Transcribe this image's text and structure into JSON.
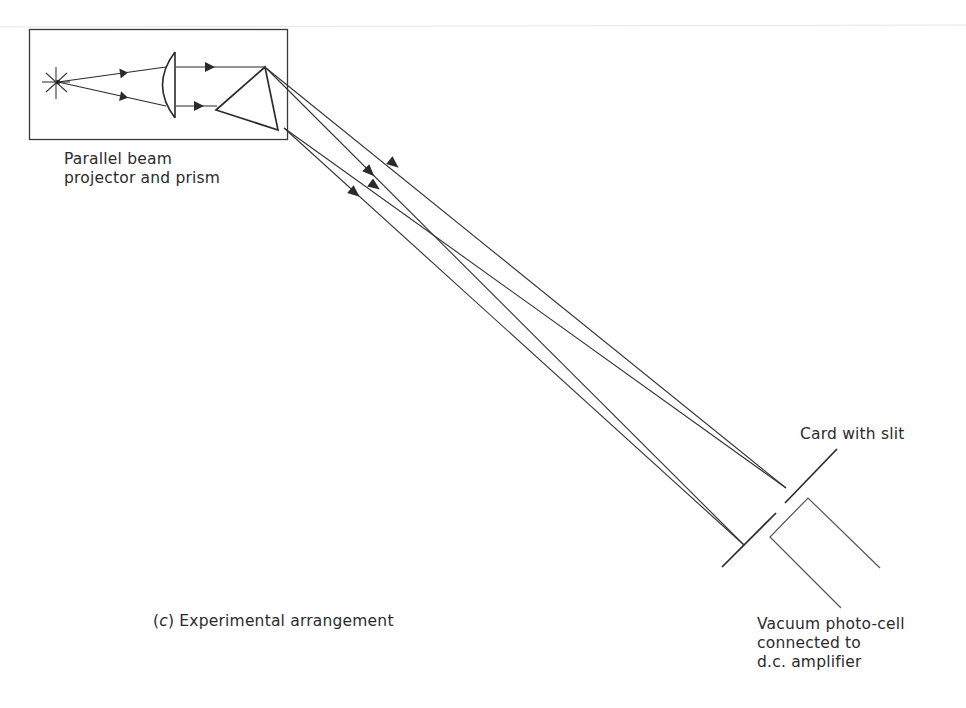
{
  "diagram": {
    "title": "Experimental arrangement",
    "panel_label": "(c)",
    "stroke_color": "#2b2b2b",
    "background": "#ffffff",
    "components": {
      "projector": {
        "label_lines": [
          "Parallel beam",
          "projector and prism"
        ],
        "parts": [
          "light-source",
          "condenser-lens",
          "prism"
        ]
      },
      "card": {
        "label": "Card with slit"
      },
      "photocell": {
        "label_lines": [
          "Vacuum photo-cell",
          "connected to",
          "d.c. amplifier"
        ]
      }
    },
    "caption": {
      "prefix": "(c)",
      "text": " Experimental arrangement"
    },
    "beams": [
      {
        "name": "upper-beam-1",
        "from": [
          266,
          68
        ],
        "to": [
          786,
          488
        ]
      },
      {
        "name": "upper-beam-2",
        "from": [
          266,
          68
        ],
        "to": [
          744,
          545
        ]
      },
      {
        "name": "lower-beam-1",
        "from": [
          284,
          128
        ],
        "to": [
          786,
          488
        ]
      },
      {
        "name": "lower-beam-2",
        "from": [
          284,
          128
        ],
        "to": [
          744,
          545
        ]
      }
    ]
  }
}
